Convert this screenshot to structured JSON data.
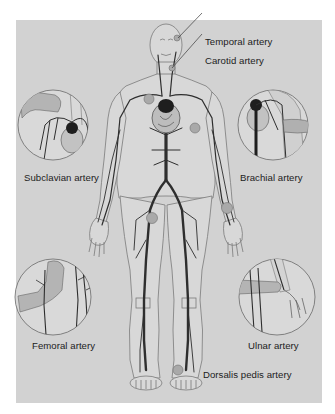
{
  "figure": {
    "colors": {
      "background": "#d2d2d2",
      "skin_fill": "#dcdcdc",
      "outline": "#7a7a7a",
      "artery": "#2e2e2e",
      "heart": "#1e1e1e",
      "pulse_point": "#a9a9a9",
      "hand": "#b4b4b4",
      "text": "#1c1c1c"
    },
    "labels": {
      "temporal": "Temporal artery",
      "carotid": "Carotid artery",
      "subclavian": "Subclavian artery",
      "brachial": "Brachial artery",
      "femoral": "Femoral artery",
      "ulnar": "Ulnar artery",
      "dorsalis_pedis": "Dorsalis pedis artery"
    },
    "insets": [
      {
        "name": "subclavian",
        "label": "Subclavian artery"
      },
      {
        "name": "brachial",
        "label": "Brachial artery"
      },
      {
        "name": "femoral",
        "label": "Femoral artery"
      },
      {
        "name": "ulnar",
        "label": "Ulnar artery"
      }
    ]
  }
}
